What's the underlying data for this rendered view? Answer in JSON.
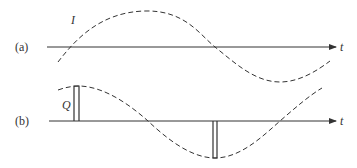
{
  "panel_a": {
    "label": "(a)",
    "curve_label": "I",
    "axis_label": "t"
  },
  "panel_b": {
    "label": "(b)",
    "pulse_label": "Q",
    "axis_label": "t"
  },
  "colors": {
    "line": "#333333",
    "background": "#ffffff"
  }
}
